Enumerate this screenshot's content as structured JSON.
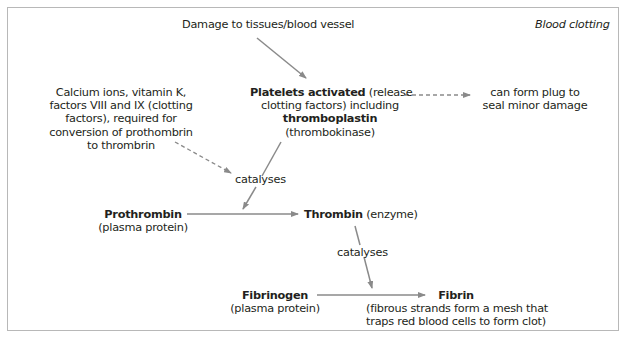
{
  "title": "Blood clotting",
  "nodes": {
    "damage": "Damage to tissues/blood vessel",
    "platelets": {
      "bold1": "Platelets activated",
      "rest1": " (release",
      "line2": "clotting factors) including",
      "bold3": "thromboplastin",
      "line4": "(thrombokinase)"
    },
    "plug": {
      "line1": "can form plug to",
      "line2": "seal minor damage"
    },
    "cofactors": {
      "line1": "Calcium ions, vitamin K,",
      "line2": "factors VIII and IX (clotting",
      "line3": "factors), required for",
      "line4": "conversion of prothombrin",
      "line5": "to thrombrin"
    },
    "catalyses1": "catalyses",
    "prothrombin": {
      "name": "Prothrombin",
      "note": "(plasma protein)"
    },
    "thrombin": {
      "name": "Thrombin",
      "note": " (enzyme)"
    },
    "catalyses2": "catalyses",
    "fibrinogen": {
      "name": "Fibrinogen",
      "note": "(plasma protein)"
    },
    "fibrin": {
      "name": "Fibrin",
      "line2": "(fibrous strands form a mesh that",
      "line3": "traps red blood cells to form clot)"
    }
  },
  "colors": {
    "arrow": "#8a8a8a",
    "text": "#231f20",
    "frame": "#b8b8b8"
  }
}
